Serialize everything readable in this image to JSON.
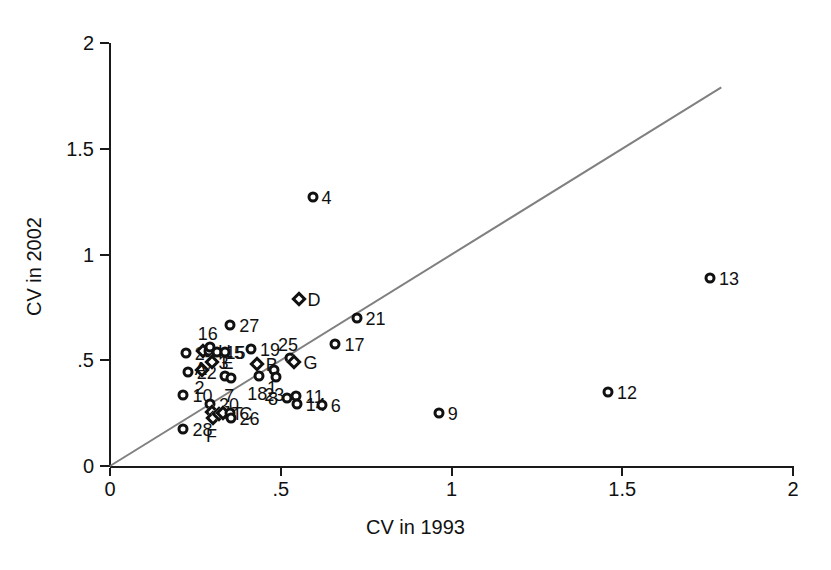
{
  "chart_data": {
    "type": "scatter",
    "title": "",
    "xlabel": "CV in 1993",
    "ylabel": "CV in 2002",
    "xlim": [
      0,
      2
    ],
    "ylim": [
      0,
      2
    ],
    "xticks": [
      "0",
      ".5",
      "1",
      "1.5",
      "2"
    ],
    "xtick_values": [
      0,
      0.5,
      1,
      1.5,
      2
    ],
    "yticks": [
      "0",
      ".5",
      "1",
      "1.5",
      "2"
    ],
    "ytick_values": [
      0,
      0.5,
      1,
      1.5,
      2
    ],
    "grid": false,
    "legend": "none",
    "reference_line": {
      "name": "identity-line",
      "type": "line",
      "from": [
        0,
        0
      ],
      "to": [
        1.79,
        1.79
      ],
      "color": "#808080",
      "width": 2,
      "description": "45-degree line of equality"
    },
    "marker_shapes": {
      "numbered": "circle",
      "lettered": "diamond"
    },
    "points": [
      {
        "label": "28",
        "x": 0.215,
        "y": 0.175,
        "marker": "circle",
        "label_pos": "right"
      },
      {
        "label": "10",
        "x": 0.215,
        "y": 0.335,
        "marker": "circle",
        "label_pos": "right"
      },
      {
        "label": "24",
        "x": 0.222,
        "y": 0.535,
        "marker": "circle",
        "label_pos": "right"
      },
      {
        "label": "22",
        "x": 0.228,
        "y": 0.445,
        "marker": "circle",
        "label_pos": "right"
      },
      {
        "label": "2",
        "x": 0.268,
        "y": 0.455,
        "marker": "diamond",
        "label_pos": "below"
      },
      {
        "label": "A",
        "x": 0.272,
        "y": 0.545,
        "marker": "diamond",
        "label_pos": "below"
      },
      {
        "label": "H",
        "x": 0.29,
        "y": 0.545,
        "marker": "circle",
        "label_pos": "right"
      },
      {
        "label": "16",
        "x": 0.292,
        "y": 0.565,
        "marker": "circle",
        "label_pos": "above"
      },
      {
        "label": "20",
        "x": 0.293,
        "y": 0.295,
        "marker": "circle",
        "label_pos": "right"
      },
      {
        "label": "E",
        "x": 0.3,
        "y": 0.49,
        "marker": "diamond",
        "label_pos": "right"
      },
      {
        "label": "J",
        "x": 0.3,
        "y": 0.255,
        "marker": "diamond",
        "label_pos": "right"
      },
      {
        "label": "F",
        "x": 0.303,
        "y": 0.228,
        "marker": "diamond",
        "label_pos": "below"
      },
      {
        "label": "15",
        "x": 0.312,
        "y": 0.54,
        "marker": "circle",
        "label_pos": "right"
      },
      {
        "label": "I",
        "x": 0.318,
        "y": 0.245,
        "marker": "diamond",
        "label_pos": "right"
      },
      {
        "label": "T",
        "x": 0.33,
        "y": 0.25,
        "marker": "diamond",
        "label_pos": "right"
      },
      {
        "label": "5",
        "x": 0.337,
        "y": 0.54,
        "marker": "circle",
        "label_pos": "right"
      },
      {
        "label": "3",
        "x": 0.338,
        "y": 0.425,
        "marker": "circle",
        "label_pos": "above"
      },
      {
        "label": "27",
        "x": 0.352,
        "y": 0.665,
        "marker": "circle",
        "label_pos": "right"
      },
      {
        "label": "C",
        "x": 0.352,
        "y": 0.252,
        "marker": "circle",
        "label_pos": "right"
      },
      {
        "label": "26",
        "x": 0.353,
        "y": 0.225,
        "marker": "circle",
        "label_pos": "right"
      },
      {
        "label": "7",
        "x": 0.355,
        "y": 0.415,
        "marker": "circle",
        "label_pos": "below"
      },
      {
        "label": "19",
        "x": 0.413,
        "y": 0.555,
        "marker": "circle",
        "label_pos": "right"
      },
      {
        "label": "B",
        "x": 0.43,
        "y": 0.48,
        "marker": "diamond",
        "label_pos": "right"
      },
      {
        "label": "18",
        "x": 0.437,
        "y": 0.425,
        "marker": "circle",
        "label_pos": "below"
      },
      {
        "label": "1",
        "x": 0.48,
        "y": 0.455,
        "marker": "circle",
        "label_pos": "below"
      },
      {
        "label": "23",
        "x": 0.487,
        "y": 0.42,
        "marker": "circle",
        "label_pos": "below"
      },
      {
        "label": "8",
        "x": 0.518,
        "y": 0.322,
        "marker": "circle",
        "label_pos": "left"
      },
      {
        "label": "11",
        "x": 0.545,
        "y": 0.33,
        "marker": "circle",
        "label_pos": "right"
      },
      {
        "label": "14",
        "x": 0.547,
        "y": 0.292,
        "marker": "circle",
        "label_pos": "right"
      },
      {
        "label": "25",
        "x": 0.527,
        "y": 0.512,
        "marker": "circle",
        "label_pos": "above"
      },
      {
        "label": "G",
        "x": 0.54,
        "y": 0.49,
        "marker": "diamond",
        "label_pos": "right"
      },
      {
        "label": "D",
        "x": 0.552,
        "y": 0.79,
        "marker": "diamond",
        "label_pos": "right"
      },
      {
        "label": "4",
        "x": 0.593,
        "y": 1.27,
        "marker": "circle",
        "label_pos": "right"
      },
      {
        "label": "6",
        "x": 0.62,
        "y": 0.288,
        "marker": "circle",
        "label_pos": "right"
      },
      {
        "label": "17",
        "x": 0.66,
        "y": 0.578,
        "marker": "circle",
        "label_pos": "right"
      },
      {
        "label": "21",
        "x": 0.722,
        "y": 0.698,
        "marker": "circle",
        "label_pos": "right"
      },
      {
        "label": "9",
        "x": 0.963,
        "y": 0.25,
        "marker": "circle",
        "label_pos": "right"
      },
      {
        "label": "12",
        "x": 1.458,
        "y": 0.348,
        "marker": "circle",
        "label_pos": "right"
      },
      {
        "label": "13",
        "x": 1.757,
        "y": 0.888,
        "marker": "circle",
        "label_pos": "right"
      }
    ]
  }
}
